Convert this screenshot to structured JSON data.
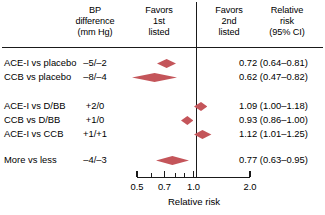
{
  "chart_data": {
    "type": "forest",
    "title": "",
    "xlabel": "Relative risk",
    "ylabel": "",
    "xscale": "log",
    "xlim": [
      0.5,
      2.0
    ],
    "reference_line": 1.0,
    "grid": false,
    "legend": "none",
    "accent_color": "#c4555a",
    "axis_color": "#1a1a1a",
    "tick_values": [
      0.5,
      0.6,
      0.7,
      0.8,
      0.9,
      1.0,
      2.0
    ],
    "tick_labels_shown": [
      "0.5",
      "0.7",
      "1.0",
      "2.0"
    ],
    "columns": [
      "Comparison",
      "BP difference (mm Hg)",
      "Relative risk (95% CI)"
    ],
    "series": [
      {
        "name": "ACE-I vs placebo",
        "bp_difference": "–5/–2",
        "rr": 0.72,
        "ci_low": 0.64,
        "ci_high": 0.81,
        "ci_text": "0.72 (0.64–0.81)"
      },
      {
        "name": "CCB vs placebo",
        "bp_difference": "–8/–4",
        "rr": 0.62,
        "ci_low": 0.47,
        "ci_high": 0.82,
        "ci_text": "0.62 (0.47–0.82)"
      },
      {
        "name": "ACE-I vs D/BB",
        "bp_difference": "+2/0",
        "rr": 1.09,
        "ci_low": 1.0,
        "ci_high": 1.18,
        "ci_text": "1.09 (1.00–1.18)"
      },
      {
        "name": "CCB vs D/BB",
        "bp_difference": "+1/0",
        "rr": 0.93,
        "ci_low": 0.86,
        "ci_high": 1.0,
        "ci_text": "0.93 (0.86–1.00)"
      },
      {
        "name": "ACE-I vs CCB",
        "bp_difference": "+1/+1",
        "rr": 1.12,
        "ci_low": 1.01,
        "ci_high": 1.25,
        "ci_text": "1.12 (1.01–1.25)"
      },
      {
        "name": "More vs less",
        "bp_difference": "–4/–3",
        "rr": 0.77,
        "ci_low": 0.63,
        "ci_high": 0.95,
        "ci_text": "0.77 (0.63–0.95)"
      }
    ]
  },
  "header": {
    "bp": "BP\ndifference\n(mm Hg)",
    "favors_first": "Favors\n1st\nlisted",
    "favors_second": "Favors\n2nd\nlisted",
    "relative_risk": "Relative\nrisk\n(95% CI)"
  },
  "rows": [
    {
      "label": "ACE-I vs placebo",
      "bp": "–5/–2",
      "ci": "0.72 (0.64–0.81)"
    },
    {
      "label": "CCB vs placebo",
      "bp": "–8/–4",
      "ci": "0.62 (0.47–0.82)"
    },
    {
      "label": "ACE-I vs D/BB",
      "bp": "+2/0",
      "ci": "1.09 (1.00–1.18)"
    },
    {
      "label": "CCB vs D/BB",
      "bp": "+1/0",
      "ci": "0.93 (0.86–1.00)"
    },
    {
      "label": "ACE-I vs CCB",
      "bp": "+1/+1",
      "ci": "1.12 (1.01–1.25)"
    },
    {
      "label": "More vs less",
      "bp": "–4/–3",
      "ci": "0.77 (0.63–0.95)"
    }
  ],
  "axis": {
    "title": "Relative risk",
    "labels": [
      {
        "value": "0.5",
        "at": 0.5
      },
      {
        "value": "0.7",
        "at": 0.7
      },
      {
        "value": "1.0",
        "at": 1.0
      },
      {
        "value": "2.0",
        "at": 2.0
      }
    ]
  }
}
